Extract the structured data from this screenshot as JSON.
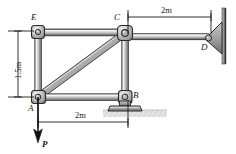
{
  "figure": {
    "type": "statics-frame-diagram",
    "background_color": "#ffffff",
    "line_color": "#1b1b1b",
    "member_fill_light": "#d8d8d8",
    "member_fill_mid": "#b3b3b3",
    "member_fill_dark": "#8a8a8a",
    "joint_fill": "#c4c4c4",
    "support_fill": "#9a9a9a",
    "ground_fill": "#dcdcdc"
  },
  "labels": {
    "joint_e": "E",
    "joint_c": "C",
    "joint_d": "D",
    "joint_a": "A",
    "joint_b": "B",
    "force_p": "P"
  },
  "dimensions": {
    "top_span": "2m",
    "bottom_span": "2m",
    "left_height": "1.5m"
  },
  "geometry": {
    "joints": [
      {
        "name": "E",
        "x": 38,
        "y": 32
      },
      {
        "name": "C",
        "x": 125,
        "y": 33
      },
      {
        "name": "A",
        "x": 38,
        "y": 97
      },
      {
        "name": "B",
        "x": 125,
        "y": 97
      },
      {
        "name": "D",
        "x": 209,
        "y": 38
      }
    ],
    "members": [
      {
        "name": "EC",
        "from": "E",
        "to": "C"
      },
      {
        "name": "EA",
        "from": "E",
        "to": "A"
      },
      {
        "name": "AB",
        "from": "A",
        "to": "B"
      },
      {
        "name": "CB",
        "from": "C",
        "to": "B"
      },
      {
        "name": "AC",
        "from": "A",
        "to": "C"
      },
      {
        "name": "CD",
        "from": "C",
        "to": "D"
      }
    ],
    "supports": [
      {
        "name": "D",
        "kind": "wall-pin"
      },
      {
        "name": "B",
        "kind": "ground-pin"
      }
    ],
    "load": {
      "name": "P",
      "at": "A",
      "direction": "down"
    }
  }
}
